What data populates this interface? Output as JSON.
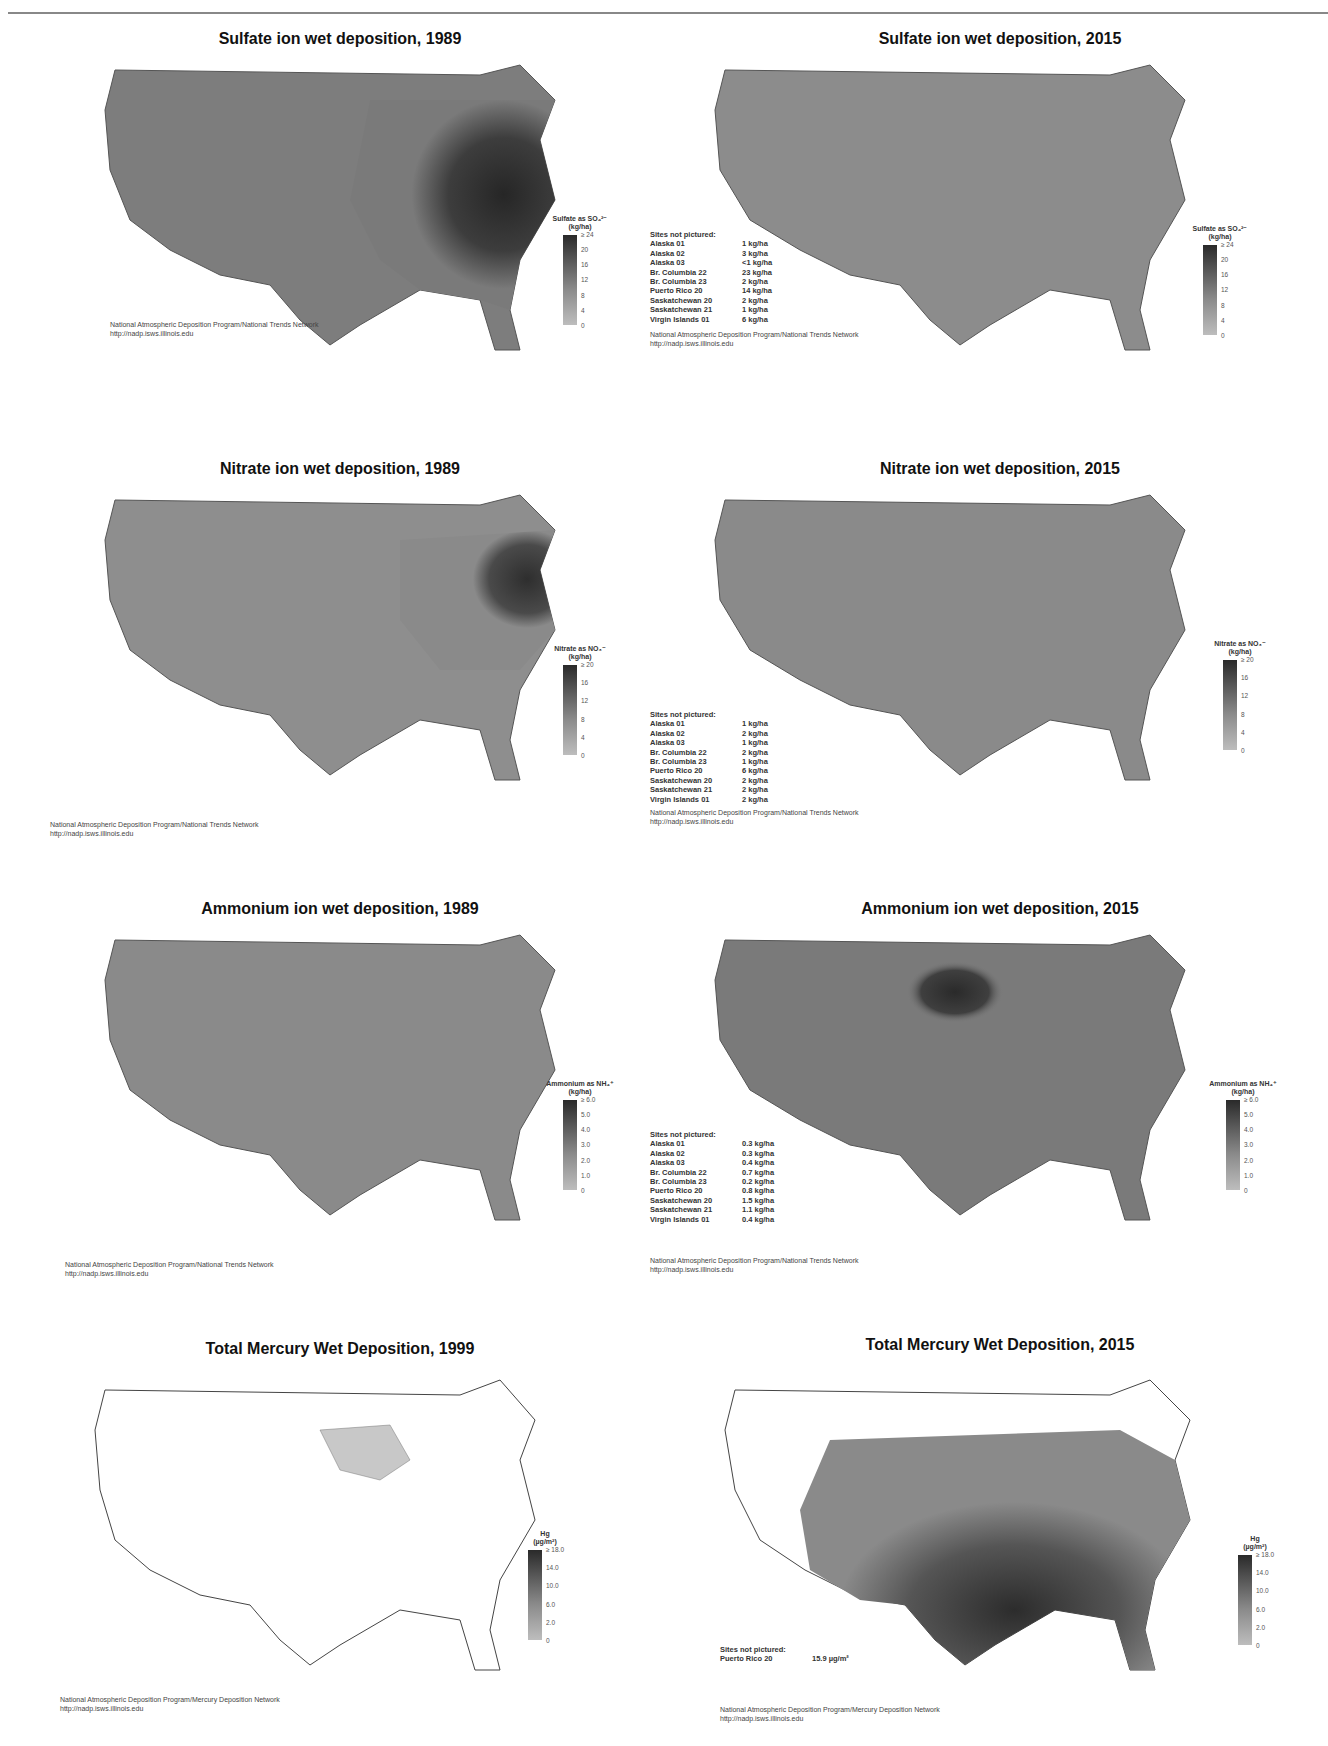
{
  "page": {
    "figure_type": "grid of US wet deposition maps (grayscale)",
    "source_org": "National Atmospheric Deposition Program"
  },
  "panels": [
    {
      "id": "sulfate-1989",
      "title": "Sulfate ion wet deposition, 1989",
      "legend": {
        "title": "Sulfate as SO₄²⁻",
        "units": "(kg/ha)",
        "ticks": [
          "≥ 24",
          "20",
          "16",
          "12",
          "8",
          "4",
          "0"
        ]
      },
      "sites_not_pictured": null,
      "credit": {
        "line1": "National Atmospheric Deposition Program/National Trends Network",
        "line2": "http://nadp.isws.illinois.edu"
      }
    },
    {
      "id": "sulfate-2015",
      "title": "Sulfate ion wet deposition, 2015",
      "legend": {
        "title": "Sulfate as SO₄²⁻",
        "units": "(kg/ha)",
        "ticks": [
          "≥ 24",
          "20",
          "16",
          "12",
          "8",
          "4",
          "0"
        ]
      },
      "sites_not_pictured": {
        "heading": "Sites not pictured:",
        "rows": [
          {
            "site": "Alaska 01",
            "value": "1 kg/ha"
          },
          {
            "site": "Alaska 02",
            "value": "3 kg/ha"
          },
          {
            "site": "Alaska 03",
            "value": "<1 kg/ha"
          },
          {
            "site": "Br. Columbia 22",
            "value": "23 kg/ha"
          },
          {
            "site": "Br. Columbia 23",
            "value": "2 kg/ha"
          },
          {
            "site": "Puerto Rico 20",
            "value": "14 kg/ha"
          },
          {
            "site": "Saskatchewan 20",
            "value": "2 kg/ha"
          },
          {
            "site": "Saskatchewan 21",
            "value": "1 kg/ha"
          },
          {
            "site": "Virgin Islands 01",
            "value": "6 kg/ha"
          }
        ]
      },
      "credit": {
        "line1": "National Atmospheric Deposition Program/National Trends Network",
        "line2": "http://nadp.isws.illinois.edu"
      }
    },
    {
      "id": "nitrate-1989",
      "title": "Nitrate ion wet deposition, 1989",
      "legend": {
        "title": "Nitrate as NO₃⁻",
        "units": "(kg/ha)",
        "ticks": [
          "≥ 20",
          "16",
          "12",
          "8",
          "4",
          "0"
        ]
      },
      "sites_not_pictured": null,
      "credit": {
        "line1": "National Atmospheric Deposition Program/National Trends Network",
        "line2": "http://nadp.isws.illinois.edu"
      }
    },
    {
      "id": "nitrate-2015",
      "title": "Nitrate ion wet deposition, 2015",
      "legend": {
        "title": "Nitrate as NO₃⁻",
        "units": "(kg/ha)",
        "ticks": [
          "≥ 20",
          "16",
          "12",
          "8",
          "4",
          "0"
        ]
      },
      "sites_not_pictured": {
        "heading": "Sites not pictured:",
        "rows": [
          {
            "site": "Alaska 01",
            "value": "1 kg/ha"
          },
          {
            "site": "Alaska 02",
            "value": "2 kg/ha"
          },
          {
            "site": "Alaska 03",
            "value": "1 kg/ha"
          },
          {
            "site": "Br. Columbia 22",
            "value": "2 kg/ha"
          },
          {
            "site": "Br. Columbia 23",
            "value": "1 kg/ha"
          },
          {
            "site": "Puerto Rico 20",
            "value": "6 kg/ha"
          },
          {
            "site": "Saskatchewan 20",
            "value": "2 kg/ha"
          },
          {
            "site": "Saskatchewan 21",
            "value": "2 kg/ha"
          },
          {
            "site": "Virgin Islands 01",
            "value": "2 kg/ha"
          }
        ]
      },
      "credit": {
        "line1": "National Atmospheric Deposition Program/National Trends Network",
        "line2": "http://nadp.isws.illinois.edu"
      }
    },
    {
      "id": "ammonium-1989",
      "title": "Ammonium ion wet deposition, 1989",
      "legend": {
        "title": "Ammonium as NH₄⁺",
        "units": "(kg/ha)",
        "ticks": [
          "≥ 6.0",
          "5.0",
          "4.0",
          "3.0",
          "2.0",
          "1.0",
          "0"
        ]
      },
      "sites_not_pictured": null,
      "credit": {
        "line1": "National Atmospheric Deposition Program/National Trends Network",
        "line2": "http://nadp.isws.illinois.edu"
      }
    },
    {
      "id": "ammonium-2015",
      "title": "Ammonium ion wet deposition, 2015",
      "legend": {
        "title": "Ammonium as NH₄⁺",
        "units": "(kg/ha)",
        "ticks": [
          "≥ 6.0",
          "5.0",
          "4.0",
          "3.0",
          "2.0",
          "1.0",
          "0"
        ]
      },
      "sites_not_pictured": {
        "heading": "Sites not pictured:",
        "rows": [
          {
            "site": "Alaska 01",
            "value": "0.3 kg/ha"
          },
          {
            "site": "Alaska 02",
            "value": "0.3 kg/ha"
          },
          {
            "site": "Alaska 03",
            "value": "0.4 kg/ha"
          },
          {
            "site": "Br. Columbia 22",
            "value": "0.7 kg/ha"
          },
          {
            "site": "Br. Columbia 23",
            "value": "0.2 kg/ha"
          },
          {
            "site": "Puerto Rico 20",
            "value": "0.8 kg/ha"
          },
          {
            "site": "Saskatchewan 20",
            "value": "1.5 kg/ha"
          },
          {
            "site": "Saskatchewan 21",
            "value": "1.1 kg/ha"
          },
          {
            "site": "Virgin Islands 01",
            "value": "0.4 kg/ha"
          }
        ]
      },
      "credit": {
        "line1": "National Atmospheric Deposition Program/National Trends Network",
        "line2": "http://nadp.isws.illinois.edu"
      }
    },
    {
      "id": "mercury-1999",
      "title": "Total Mercury Wet Deposition, 1999",
      "legend": {
        "title": "Hg",
        "units": "(µg/m²)",
        "ticks": [
          "≥ 18.0",
          "14.0",
          "10.0",
          "6.0",
          "2.0",
          "0"
        ]
      },
      "sites_not_pictured": null,
      "credit": {
        "line1": "National Atmospheric Deposition Program/Mercury Deposition Network",
        "line2": "http://nadp.isws.illinois.edu"
      }
    },
    {
      "id": "mercury-2015",
      "title": "Total Mercury Wet Deposition, 2015",
      "legend": {
        "title": "Hg",
        "units": "(µg/m²)",
        "ticks": [
          "≥ 18.0",
          "14.0",
          "10.0",
          "6.0",
          "2.0",
          "0"
        ]
      },
      "sites_not_pictured": {
        "heading": "Sites not pictured:",
        "rows": [
          {
            "site": "Puerto Rico 20",
            "value": "15.9 µg/m²"
          }
        ]
      },
      "credit": {
        "line1": "National Atmospheric Deposition Program/Mercury Deposition Network",
        "line2": "http://nadp.isws.illinois.edu"
      }
    }
  ]
}
